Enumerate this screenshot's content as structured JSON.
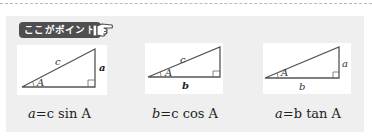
{
  "badge": {
    "label": "ここがポイント",
    "icon": "pointing-hand-icon"
  },
  "diagrams": [
    {
      "hypotenuse": "c",
      "opposite": "a",
      "adjacent": "",
      "angle": "A",
      "bold_side": "a"
    },
    {
      "hypotenuse": "c",
      "opposite": "",
      "adjacent": "b",
      "angle": "A",
      "bold_side": "b"
    },
    {
      "hypotenuse": "",
      "opposite": "a",
      "adjacent": "b",
      "angle": "A",
      "bold_side": "a"
    }
  ],
  "formulas": [
    {
      "lhs": "a",
      "eq": "=",
      "rhs": "c sin A"
    },
    {
      "lhs": "b",
      "eq": "=",
      "rhs": "c cos A"
    },
    {
      "lhs": "a",
      "eq": "=",
      "rhs": "b tan A"
    }
  ]
}
